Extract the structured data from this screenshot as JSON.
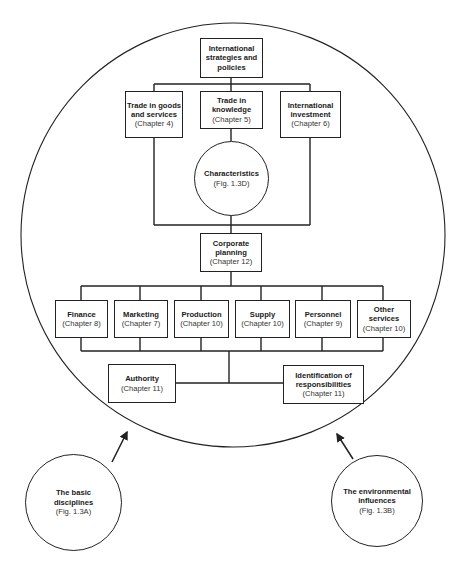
{
  "diagram": {
    "top": {
      "title": "International strategies and policies"
    },
    "trade_goods": {
      "title": "Trade in goods and services",
      "ref": "(Chapter 4)"
    },
    "trade_knowledge": {
      "title": "Trade in knowledge",
      "ref": "(Chapter 5)"
    },
    "intl_investment": {
      "title": "International investment",
      "ref": "(Chapter 6)"
    },
    "characteristics": {
      "title": "Characteristics",
      "ref": "(Fig. 1.3D)"
    },
    "corporate_planning": {
      "title": "Corporate planning",
      "ref": "(Chapter 12)"
    },
    "departments": [
      {
        "title": "Finance",
        "ref": "(Chapter 8)"
      },
      {
        "title": "Marketing",
        "ref": "(Chapter 7)"
      },
      {
        "title": "Production",
        "ref": "(Chapter 10)"
      },
      {
        "title": "Supply",
        "ref": "(Chapter 10)"
      },
      {
        "title": "Personnel",
        "ref": "(Chapter 9)"
      },
      {
        "title": "Other services",
        "ref": "(Chapter 10)"
      }
    ],
    "authority": {
      "title": "Authority",
      "ref": "(Chapter 11)"
    },
    "identification": {
      "title": "Identification of responsibilities",
      "ref": "(Chapter 11)"
    },
    "basic_disciplines": {
      "title": "The basic disciplines",
      "ref": "(Fig. 1.3A)"
    },
    "environmental_influences": {
      "title": "The environmental influences",
      "ref": "(Fig. 1.3B)"
    }
  }
}
